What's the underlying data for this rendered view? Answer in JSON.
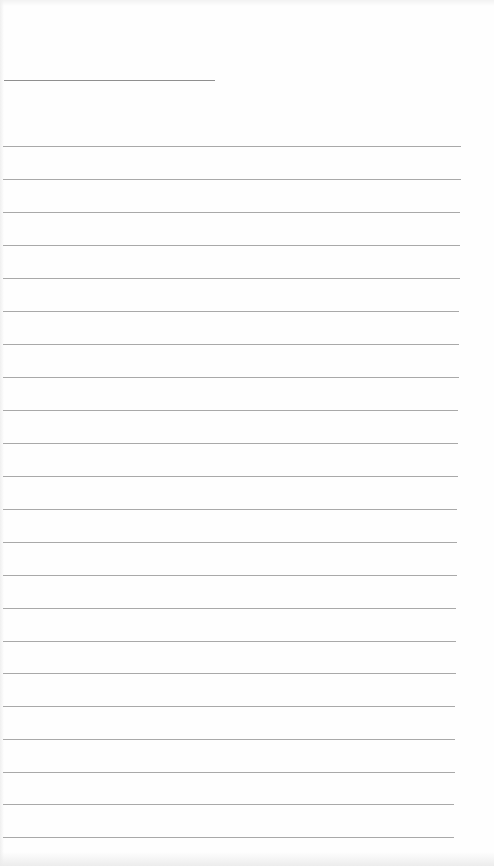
{
  "page": {
    "type": "blank ruled sheet",
    "background_color": "#fefefe",
    "rule_color": "#9a9a9a",
    "title_line": {
      "x": 4,
      "y": 80,
      "width": 211
    },
    "rules": [
      {
        "y": 146,
        "x": 3,
        "width": 458
      },
      {
        "y": 179,
        "x": 3,
        "width": 458
      },
      {
        "y": 212,
        "x": 3,
        "width": 457
      },
      {
        "y": 245,
        "x": 3,
        "width": 457
      },
      {
        "y": 278,
        "x": 3,
        "width": 457
      },
      {
        "y": 311,
        "x": 3,
        "width": 456
      },
      {
        "y": 344,
        "x": 3,
        "width": 456
      },
      {
        "y": 377,
        "x": 3,
        "width": 456
      },
      {
        "y": 410,
        "x": 3,
        "width": 455
      },
      {
        "y": 443,
        "x": 3,
        "width": 455
      },
      {
        "y": 476,
        "x": 3,
        "width": 455
      },
      {
        "y": 509,
        "x": 3,
        "width": 454
      },
      {
        "y": 542,
        "x": 3,
        "width": 454
      },
      {
        "y": 575,
        "x": 3,
        "width": 454
      },
      {
        "y": 608,
        "x": 3,
        "width": 453
      },
      {
        "y": 641,
        "x": 3,
        "width": 453
      },
      {
        "y": 673,
        "x": 3,
        "width": 453
      },
      {
        "y": 706,
        "x": 3,
        "width": 452
      },
      {
        "y": 739,
        "x": 3,
        "width": 452
      },
      {
        "y": 772,
        "x": 3,
        "width": 452
      },
      {
        "y": 804,
        "x": 3,
        "width": 451
      },
      {
        "y": 837,
        "x": 3,
        "width": 451
      }
    ]
  }
}
